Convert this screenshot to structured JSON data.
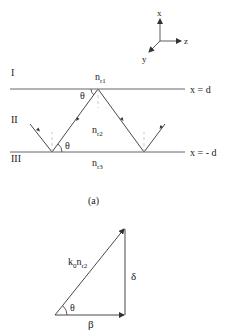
{
  "figure_a": {
    "axes": {
      "x": "x",
      "y": "y",
      "z": "z"
    },
    "regions": {
      "top": "I",
      "middle": "II",
      "bottom": "III"
    },
    "indices": {
      "n1_base": "n",
      "n1_sub": "r1",
      "n2_base": "n",
      "n2_sub": "r2",
      "n3_base": "n",
      "n3_sub": "r3"
    },
    "boundaries": {
      "top": "x = d",
      "bottom": "x = - d"
    },
    "angle_top": "θ",
    "angle_bottom": "θ",
    "caption": "(a)"
  },
  "figure_b": {
    "hypotenuse_k": "k",
    "hypotenuse_k_sub": "0",
    "hypotenuse_n": "n",
    "hypotenuse_n_sub": "r2",
    "vertical": "δ",
    "horizontal": "β",
    "angle": "θ"
  },
  "colors": {
    "line": "#333333",
    "dashed": "#bbbbbb"
  }
}
